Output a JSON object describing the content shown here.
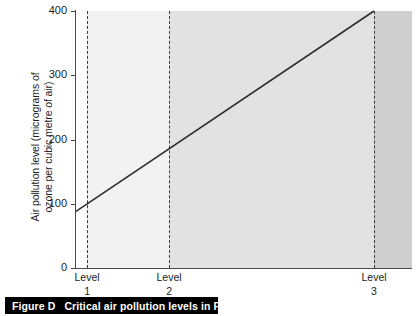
{
  "caption": {
    "figure_label": "Figure D",
    "text": "Critical air pollution levels in Paris"
  },
  "chart_data": {
    "type": "line",
    "title": "Critical air pollution levels in Paris",
    "xlabel": "",
    "ylabel": "Air pollution level (micrograms of ozone per cubic metre of air)",
    "ylabel_line1": "Air pollution level (micrograms of",
    "ylabel_line2": "ozone per cubic metre of air)",
    "ylim": [
      0,
      400
    ],
    "yticks": [
      0,
      100,
      200,
      300,
      400
    ],
    "ytick_labels": [
      "0",
      "100",
      "200",
      "300",
      "400"
    ],
    "grid": false,
    "legend": "none",
    "x": [
      0,
      1,
      2,
      3
    ],
    "series": [
      {
        "name": "Ozone level",
        "values": [
          88,
          100,
          187,
          400
        ],
        "points": [
          {
            "x_frac": 0.0,
            "y": 88
          },
          {
            "x_frac": 0.033,
            "y": 100
          },
          {
            "x_frac": 0.277,
            "y": 187
          },
          {
            "x_frac": 0.887,
            "y": 400
          }
        ]
      }
    ],
    "annotations": {
      "level_markers": [
        {
          "name": "Level",
          "number": "1",
          "x_frac": 0.033,
          "value_at_line": 100
        },
        {
          "name": "Level",
          "number": "2",
          "x_frac": 0.277,
          "value_at_line": 187
        },
        {
          "name": "Level",
          "number": "3",
          "x_frac": 0.887,
          "value_at_line": 400
        }
      ],
      "bands": [
        {
          "name": "below-level-1",
          "color": "#ffffff"
        },
        {
          "name": "level-1-to-2",
          "color": "#f2f2f2"
        },
        {
          "name": "level-2-to-3",
          "color": "#e2e2e2"
        },
        {
          "name": "above-level-3",
          "color": "#cfcfcf"
        }
      ]
    }
  },
  "axis": {
    "y": {
      "ticks": [
        {
          "label": "400"
        },
        {
          "label": "300"
        },
        {
          "label": "200"
        },
        {
          "label": "100"
        },
        {
          "label": "0"
        }
      ]
    },
    "x": {
      "levels": [
        {
          "name": "Level",
          "number": "1"
        },
        {
          "name": "Level",
          "number": "2"
        },
        {
          "name": "Level",
          "number": "3"
        }
      ]
    }
  },
  "colors": {
    "line": "#2d2d2d",
    "axis": "#4a4a4a",
    "dash": "#3b3b3b",
    "caption_bg": "#000000",
    "caption_fg": "#ffffff"
  }
}
